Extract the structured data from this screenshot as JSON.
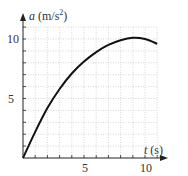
{
  "chart_data": {
    "type": "line",
    "title": "",
    "xlabel": "t (s)",
    "ylabel": "a (m/s²)",
    "xlim": [
      0,
      11
    ],
    "ylim": [
      0,
      11
    ],
    "grid": true,
    "x_ticks": [
      5,
      10
    ],
    "y_ticks": [
      5,
      10
    ],
    "series": [
      {
        "name": "a(t)",
        "x": [
          0,
          1,
          2,
          3,
          4,
          5,
          6,
          7,
          8,
          9,
          10,
          11
        ],
        "y": [
          0,
          2.2,
          4.2,
          5.8,
          7.1,
          8.1,
          8.9,
          9.5,
          9.9,
          10.1,
          10.0,
          9.6
        ]
      }
    ]
  },
  "axes": {
    "y_label_var": "a",
    "y_label_unit": "(m/s",
    "y_label_exp": "2",
    "y_label_close": ")",
    "x_label_var": "t",
    "x_label_unit": "(s)",
    "x_tick_5": "5",
    "x_tick_10": "10",
    "y_tick_5": "5",
    "y_tick_10": "10"
  }
}
